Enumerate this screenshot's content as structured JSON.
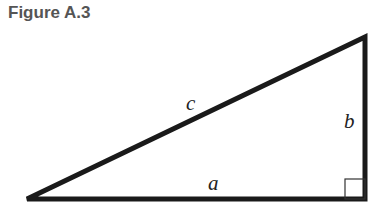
{
  "figure": {
    "title": "Figure A.3",
    "labels": {
      "hypotenuse": "c",
      "vertical_leg": "b",
      "horizontal_leg": "a"
    },
    "colors": {
      "title": "#555555",
      "stroke": "#1a1a1a"
    },
    "right_angle_marker": true
  }
}
